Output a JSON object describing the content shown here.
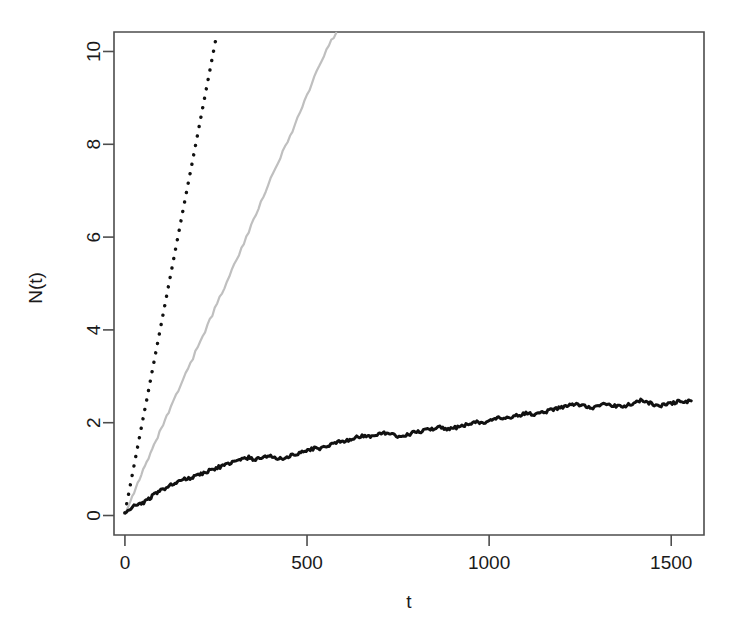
{
  "chart_data": {
    "type": "line",
    "title": "",
    "xlabel": "t",
    "ylabel": "N(t)",
    "xlim": [
      -30,
      1590
    ],
    "ylim": [
      -0.42,
      10.42
    ],
    "xticks": [
      0,
      500,
      1000,
      1500
    ],
    "xticklabels": [
      "0",
      "500",
      "1000",
      "1500"
    ],
    "yticks": [
      0,
      2,
      4,
      6,
      8,
      10
    ],
    "yticklabels": [
      "0",
      "2",
      "4",
      "6",
      "8",
      "10"
    ],
    "grid": false,
    "legend": "none",
    "series": [
      {
        "name": "dotted-reference-line",
        "style": "dotted",
        "color": "#111111",
        "x": [
          0,
          10,
          20,
          30,
          40,
          50,
          60,
          70,
          80,
          90,
          100,
          110,
          120,
          130,
          140,
          150,
          160,
          170,
          180,
          190,
          200,
          210,
          220,
          230,
          240,
          250,
          255
        ],
        "y": [
          0.05,
          0.46,
          0.87,
          1.28,
          1.69,
          2.1,
          2.5,
          2.91,
          3.32,
          3.73,
          4.14,
          4.55,
          4.96,
          5.37,
          5.78,
          6.19,
          6.6,
          7.01,
          7.41,
          7.82,
          8.23,
          8.64,
          9.05,
          9.46,
          9.87,
          10.28,
          10.4
        ]
      },
      {
        "name": "gray-solid-line",
        "style": "solid",
        "color": "#bfbfbf",
        "x": [
          0,
          15,
          30,
          45,
          60,
          75,
          90,
          105,
          120,
          140,
          160,
          180,
          200,
          220,
          240,
          260,
          280,
          300,
          320,
          340,
          360,
          380,
          400,
          420,
          440,
          460,
          480,
          500,
          520,
          540,
          560,
          580
        ],
        "y": [
          0.06,
          0.32,
          0.6,
          0.88,
          1.14,
          1.41,
          1.69,
          1.96,
          2.22,
          2.58,
          2.93,
          3.28,
          3.63,
          3.98,
          4.33,
          4.69,
          5.04,
          5.4,
          5.76,
          6.12,
          6.49,
          6.86,
          7.24,
          7.6,
          7.95,
          8.3,
          8.68,
          9.05,
          9.44,
          9.8,
          10.15,
          10.4
        ]
      },
      {
        "name": "black-empirical-curve",
        "style": "solid",
        "color": "#111111",
        "x": [
          0,
          8,
          16,
          25,
          35,
          45,
          55,
          65,
          75,
          85,
          95,
          105,
          118,
          130,
          145,
          160,
          175,
          190,
          205,
          220,
          235,
          250,
          265,
          280,
          295,
          310,
          325,
          340,
          355,
          370,
          385,
          400,
          415,
          430,
          445,
          460,
          475,
          490,
          505,
          520,
          535,
          550,
          565,
          580,
          595,
          610,
          625,
          640,
          655,
          670,
          685,
          700,
          715,
          730,
          745,
          760,
          775,
          790,
          805,
          820,
          835,
          850,
          865,
          880,
          895,
          910,
          925,
          940,
          955,
          970,
          985,
          1000,
          1015,
          1030,
          1045,
          1060,
          1075,
          1090,
          1105,
          1120,
          1135,
          1150,
          1165,
          1180,
          1195,
          1210,
          1225,
          1240,
          1255,
          1270,
          1285,
          1300,
          1315,
          1330,
          1345,
          1360,
          1375,
          1390,
          1405,
          1420,
          1435,
          1450,
          1465,
          1480,
          1495,
          1510,
          1525,
          1540,
          1555
        ],
        "y": [
          0.05,
          0.1,
          0.14,
          0.2,
          0.26,
          0.24,
          0.3,
          0.36,
          0.42,
          0.47,
          0.52,
          0.57,
          0.63,
          0.66,
          0.72,
          0.78,
          0.8,
          0.84,
          0.88,
          0.93,
          0.98,
          1.02,
          1.06,
          1.1,
          1.14,
          1.18,
          1.22,
          1.25,
          1.2,
          1.24,
          1.26,
          1.27,
          1.24,
          1.22,
          1.26,
          1.3,
          1.34,
          1.38,
          1.41,
          1.45,
          1.44,
          1.49,
          1.53,
          1.57,
          1.6,
          1.62,
          1.66,
          1.7,
          1.72,
          1.7,
          1.72,
          1.76,
          1.78,
          1.74,
          1.72,
          1.7,
          1.74,
          1.78,
          1.8,
          1.83,
          1.86,
          1.88,
          1.91,
          1.88,
          1.86,
          1.9,
          1.93,
          1.96,
          1.99,
          2.02,
          2.0,
          2.04,
          2.07,
          2.1,
          2.08,
          2.12,
          2.15,
          2.18,
          2.2,
          2.17,
          2.2,
          2.23,
          2.26,
          2.29,
          2.32,
          2.35,
          2.38,
          2.4,
          2.38,
          2.35,
          2.33,
          2.36,
          2.39,
          2.38,
          2.36,
          2.34,
          2.37,
          2.4,
          2.45,
          2.48,
          2.44,
          2.4,
          2.36,
          2.38,
          2.41,
          2.44,
          2.46,
          2.45,
          2.47
        ]
      }
    ],
    "noise": {
      "black_curve_jitter_amplitude": 0.035,
      "gray_curve_jitter_amplitude": 0.035
    }
  }
}
